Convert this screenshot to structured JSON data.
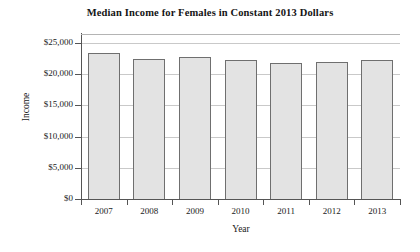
{
  "chart_data": {
    "type": "bar",
    "title": "Median Income for Females in Constant 2013 Dollars",
    "xlabel": "Year",
    "ylabel": "Income",
    "categories": [
      "2007",
      "2008",
      "2009",
      "2010",
      "2011",
      "2012",
      "2013"
    ],
    "values": [
      23400,
      22500,
      22700,
      22200,
      21800,
      21900,
      22300
    ],
    "ylim": [
      0,
      25000
    ],
    "ytick_values": [
      0,
      5000,
      10000,
      15000,
      20000,
      25000
    ],
    "ytick_labels": [
      "$0",
      "$5,000",
      "$10,000",
      "$15,000",
      "$20,000",
      "$25,000"
    ],
    "grid": true,
    "grid_axis": "y",
    "legend": false,
    "legend_position": "none",
    "bar_fill_color": "#e3e3e3",
    "bar_border_color": "#6f6f6f",
    "axis_color": "#555555",
    "gridline_color": "#c9c9c9",
    "text_color": "#1a1a1a",
    "background_color": "#ffffff"
  }
}
